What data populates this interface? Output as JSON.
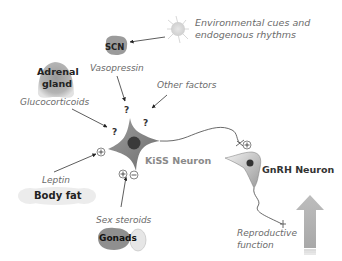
{
  "diagram": {
    "title": "",
    "nodes": {
      "environment": {
        "label_line1": "Environmental cues and",
        "label_line2": "endogenous rhythms",
        "icon": "sun-icon"
      },
      "scn": {
        "label": "SCN",
        "signal": "Vasopressin"
      },
      "adrenal": {
        "label_line1": "Adrenal",
        "label_line2": "gland",
        "signal": "Glucocorticoids"
      },
      "other": {
        "signal": "Other factors"
      },
      "body_fat": {
        "label": "Body fat",
        "signal": "Leptin"
      },
      "gonads": {
        "label": "Gonads",
        "signal": "Sex steroids"
      },
      "kiss": {
        "label": "KiSS Neuron"
      },
      "gnrh": {
        "label": "GnRH Neuron"
      },
      "output": {
        "label_line1": "Reproductive",
        "label_line2": "function",
        "icon": "up-arrow-icon"
      }
    },
    "markers": {
      "question": "?",
      "plus": "+",
      "minus": "−"
    },
    "edges": [
      {
        "from": "environment",
        "to": "scn",
        "sign": ""
      },
      {
        "from": "scn",
        "to": "kiss",
        "sign": "?"
      },
      {
        "from": "adrenal",
        "to": "kiss",
        "sign": "?"
      },
      {
        "from": "other",
        "to": "kiss",
        "sign": "?"
      },
      {
        "from": "body_fat",
        "to": "kiss",
        "sign": "+"
      },
      {
        "from": "gonads",
        "to": "kiss",
        "sign": "+/−"
      },
      {
        "from": "kiss",
        "to": "gnrh",
        "sign": "+"
      },
      {
        "from": "gnrh",
        "to": "output",
        "sign": ""
      }
    ]
  }
}
